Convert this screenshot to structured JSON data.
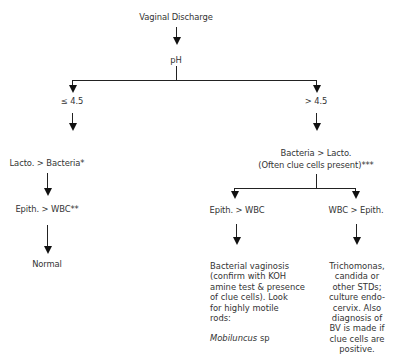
{
  "diagram": {
    "root": "Vaginal Discharge",
    "test": "pH",
    "branches": {
      "low": {
        "label": "≤ 4.5",
        "step1": "Lacto. > Bacteria*",
        "step2": "Epith. > WBC**",
        "result": "Normal"
      },
      "high": {
        "label": "> 4.5",
        "step1_line1": "Bacteria > Lacto.",
        "step1_line2": "(Often clue cells present)***",
        "left": {
          "label": "Epith. > WBC",
          "result_lines": [
            "Bacterial vaginosis",
            "(confirm with KOH",
            "amine test & presence",
            "of clue cells).  Look",
            "for highly motile",
            "rods:"
          ],
          "organism": "Mobiluncus",
          "organism_suffix": " sp"
        },
        "right": {
          "label": "WBC > Epith.",
          "result_lines": [
            "Trichomonas,",
            "candida or",
            "other STDs;",
            "culture endo-",
            "cervix.  Also",
            "diagnosis of",
            "BV is made if",
            "clue cells are",
            "positive."
          ]
        }
      }
    }
  }
}
